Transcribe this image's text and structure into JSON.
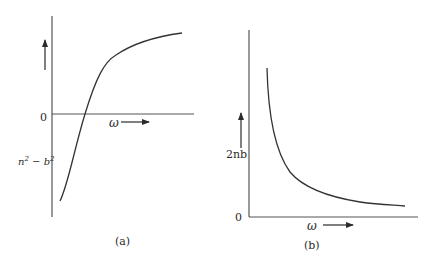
{
  "panels": [
    {
      "id": "a",
      "caption": "(a)",
      "origin_label": "0",
      "x_axis_label": "ω",
      "y_axis_label": "n² − b²",
      "y_label_base": "n",
      "y_label_sup1": "2",
      "y_label_minus": " − b",
      "y_label_sup2": "2",
      "description": "S-shaped curve crossing zero, rising and saturating at high ω"
    },
    {
      "id": "b",
      "caption": "(b)",
      "origin_label": "0",
      "x_axis_label": "ω",
      "y_axis_label": "2nb",
      "description": "Monotonically decreasing curve approaching zero at high ω"
    }
  ],
  "colors": {
    "axis": "#555555",
    "curve": "#333333",
    "text": "#2b2b2b"
  }
}
